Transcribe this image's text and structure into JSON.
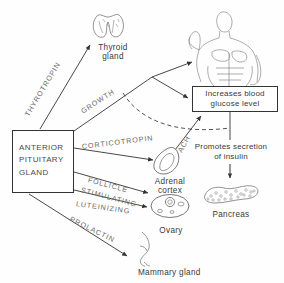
{
  "diagram": {
    "source_box": {
      "lines": "ANTERIOR\nPITUITARY\nGLAND",
      "label": "ANTERIOR PITUITARY GLAND"
    },
    "effect_box": {
      "line1": "Increases blood",
      "line2": "glucose level"
    },
    "insulin_box": {
      "line1": "Promotes secretion",
      "line2": "of  insulin"
    },
    "hormones": [
      {
        "id": "thyrotropin",
        "label": "THYROTROPIN",
        "target": "Thyroid gland"
      },
      {
        "id": "growth",
        "label": "GROWTH",
        "target": "Body / Increases blood glucose level"
      },
      {
        "id": "corticotropin",
        "label": "CORTICOTROPIN",
        "target": "Adrenal cortex"
      },
      {
        "id": "follicle",
        "label": "FOLLICLE",
        "target": "Ovary"
      },
      {
        "id": "stimulating",
        "label": "STIMULATING",
        "target": "Ovary"
      },
      {
        "id": "luteinizing",
        "label": "LUTEINIZING",
        "target": "Ovary"
      },
      {
        "id": "prolactin",
        "label": "PROLACTIN",
        "target": "Mammary gland"
      },
      {
        "id": "ach",
        "label": "ACH",
        "target": "Increases blood glucose level"
      }
    ],
    "organs": [
      {
        "id": "thyroid",
        "line1": "Thyroid",
        "line2": "gland"
      },
      {
        "id": "adrenal",
        "line1": "Adrenal",
        "line2": "cortex"
      },
      {
        "id": "ovary",
        "line1": "Ovary",
        "line2": ""
      },
      {
        "id": "pancreas",
        "line1": "Pancreas",
        "line2": ""
      },
      {
        "id": "mammary",
        "line1": "Mammary gland",
        "line2": ""
      },
      {
        "id": "body",
        "line1": "",
        "line2": ""
      }
    ],
    "colors": {
      "ink": "#333333",
      "text": "#4a4a4a",
      "hormone_text": "#6b6b6b",
      "background": "#fefefe",
      "organ_outline": "#555555"
    }
  }
}
